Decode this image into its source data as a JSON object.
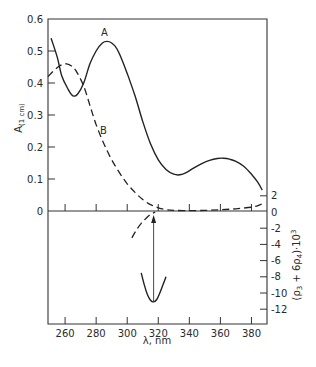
{
  "chart_data": {
    "type": "line",
    "title": "",
    "xlabel": "λ, nm",
    "ylabel_left": "A(1 cm)",
    "ylabel_right": "(ρ3 + 6ρ4)·10³",
    "xlim": [
      249,
      390
    ],
    "ylim_left": [
      0,
      0.6
    ],
    "ylim_right": [
      -14,
      2.5
    ],
    "grid": false,
    "legend": "inline labels",
    "x_ticks": [
      260,
      280,
      300,
      320,
      340,
      360,
      380
    ],
    "y_left_ticks": [
      0,
      0.1,
      0.2,
      0.3,
      0.4,
      0.5,
      0.6
    ],
    "y_left_tick_labels": [
      "0",
      "0.1",
      "0.2",
      "0.3",
      "0.4",
      "0.5",
      "0.6"
    ],
    "y_right_ticks": [
      2,
      0,
      -2,
      -4,
      -6,
      -8,
      -10,
      -12
    ],
    "y_right_tick_labels": [
      "2",
      "0",
      "-2",
      "-4",
      "-6",
      "-8",
      "-10",
      "-12"
    ],
    "series": [
      {
        "name": "A",
        "axis": "left",
        "style": "solid",
        "x": [
          251,
          255,
          258,
          262,
          265,
          268,
          272,
          276,
          280,
          284,
          287,
          290,
          293,
          296,
          300,
          305,
          310,
          315,
          320,
          325,
          330,
          334,
          338,
          343,
          348,
          353,
          358,
          362,
          366,
          370,
          375,
          380,
          384,
          387
        ],
        "y": [
          0.54,
          0.48,
          0.42,
          0.38,
          0.36,
          0.365,
          0.4,
          0.46,
          0.5,
          0.525,
          0.53,
          0.525,
          0.51,
          0.48,
          0.43,
          0.36,
          0.28,
          0.21,
          0.16,
          0.13,
          0.115,
          0.113,
          0.12,
          0.135,
          0.148,
          0.158,
          0.164,
          0.165,
          0.162,
          0.155,
          0.14,
          0.115,
          0.09,
          0.065
        ]
      },
      {
        "name": "B",
        "axis": "left",
        "style": "dashed",
        "x": [
          249,
          253,
          257,
          261,
          265,
          268,
          272,
          276,
          280,
          285,
          290,
          295,
          300,
          305,
          310,
          315,
          320,
          325,
          330,
          340,
          350,
          360,
          370,
          380,
          385,
          389
        ],
        "y": [
          0.42,
          0.44,
          0.455,
          0.46,
          0.45,
          0.43,
          0.39,
          0.33,
          0.27,
          0.21,
          0.16,
          0.12,
          0.085,
          0.058,
          0.036,
          0.02,
          0.01,
          0.004,
          0.002,
          0.001,
          0.002,
          0.004,
          0.007,
          0.012,
          0.018,
          0.027
        ]
      },
      {
        "name": "CD-dashed",
        "axis": "right",
        "style": "dashed",
        "x": [
          303,
          306,
          309,
          312,
          315,
          318
        ],
        "y": [
          -3.2,
          -2.2,
          -1.4,
          -0.8,
          -0.3,
          0.0
        ]
      },
      {
        "name": "CD-solid",
        "axis": "right",
        "style": "solid",
        "x": [
          309,
          311,
          313,
          315,
          317,
          319,
          321,
          323,
          325
        ],
        "y": [
          -7.5,
          -9.0,
          -10.2,
          -10.9,
          -11.1,
          -10.8,
          -10.0,
          -9.0,
          -8.0
        ]
      }
    ],
    "annotations": [
      {
        "type": "text",
        "text": "A",
        "x": 288,
        "y": 0.56,
        "axis": "left"
      },
      {
        "type": "text",
        "text": "B",
        "x": 287,
        "y": 0.25,
        "axis": "left"
      },
      {
        "type": "arrow",
        "x": 317,
        "from_y": -11.0,
        "to_y": 0.0,
        "axis": "right"
      }
    ]
  },
  "labels": {
    "curve_a": "A",
    "curve_b": "B",
    "xlabel": "λ, nm",
    "ylabel_left_main": "A",
    "ylabel_left_sub": "(1 cm)",
    "ylabel_right_main": "(ρ",
    "ylabel_right_sub3": "3",
    "ylabel_right_mid": " + 6ρ",
    "ylabel_right_sub4": "4",
    "ylabel_right_end": ")·10",
    "ylabel_right_sup": "3"
  }
}
